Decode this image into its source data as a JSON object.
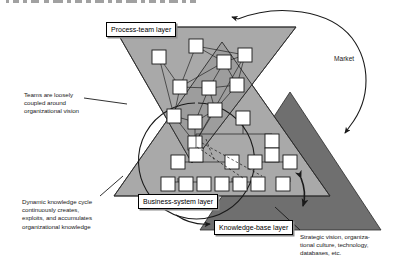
{
  "figure": {
    "type": "conceptual-diagram",
    "background": "#ffffff"
  },
  "colors": {
    "light_triangle": "#a9a9a9",
    "overlap_triangle": "#999999",
    "dark_triangle": "#6f6f6f",
    "node_fill": "#ffffff",
    "stroke": "#1a1a1a",
    "label_box_bg": "#ffffff",
    "label_box_shadow": "#8c8c8c"
  },
  "layer_labels": [
    {
      "id": "process-team",
      "text": "Process-team layer",
      "x": 106,
      "y": 22
    },
    {
      "id": "business-system",
      "text": "Business-system layer",
      "x": 138,
      "y": 195
    },
    {
      "id": "knowledge-base",
      "text": "Knowledge-base layer",
      "x": 216,
      "y": 221
    }
  ],
  "annotations": [
    {
      "id": "teams-note",
      "text": "Teams are loosely\ncoupled around\norganizational vision",
      "x": 24,
      "y": 92,
      "width": 88,
      "align": "left"
    },
    {
      "id": "cycle-note",
      "text": "Dynamic knowledge cycle\ncontinuously creates,\nexploits, and accumulates\norganizational knowledge",
      "x": 22,
      "y": 199,
      "width": 108,
      "align": "left"
    },
    {
      "id": "strategic-note",
      "text": "Strategic vision, organiza-\ntional culture, technology,\ndatabases, etc.",
      "x": 300,
      "y": 234,
      "width": 112,
      "align": "left"
    }
  ],
  "market": {
    "label": "Market",
    "x": 336,
    "y": 56
  },
  "shapes": {
    "process_team_triangle": {
      "name": "inverted-triangle",
      "points": "114,27 296,27 192,163",
      "fill": "#a9a9a9"
    },
    "business_system_triangle": {
      "name": "upright-triangle",
      "points": "222,42 330,196 114,196",
      "fill": "#a9a9a9"
    },
    "knowledge_base_triangle": {
      "name": "dark-upright-triangle",
      "points": "290,92 381,230 200,230",
      "fill": "#6f6f6f"
    }
  },
  "network_nodes": {
    "count": 13,
    "description": "loosely coupled team nodes inside the process-team layer"
  },
  "hierarchy_nodes": {
    "count": 14,
    "description": "tree-structured nodes inside the business-system layer"
  },
  "cycle_arrow": {
    "name": "dynamic-knowledge-cycle",
    "description": "large circle arrow terminating at the knowledge-base layer label"
  },
  "market_arrow": {
    "name": "market-feedback-arc",
    "description": "arc from the business-system layer up and over to the process-team layer"
  },
  "double_arrow": {
    "name": "bidirectional-layer-arrow",
    "description": "short double-headed arrow between business-system and knowledge-base layers"
  }
}
